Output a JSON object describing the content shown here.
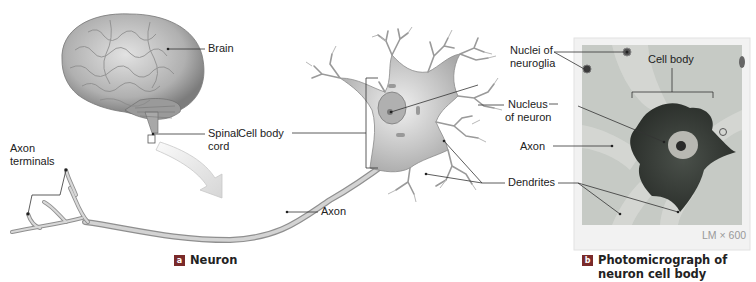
{
  "panel_a": {
    "badge": "a",
    "caption": "Neuron",
    "labels": {
      "brain": "Brain",
      "spinal_cord_1": "Spinal",
      "spinal_cord_2": "cord",
      "axon_terminals_1": "Axon",
      "axon_terminals_2": "terminals",
      "cell_body": "Cell body",
      "axon": "Axon"
    }
  },
  "shared_labels": {
    "nucleus_1": "Nucleus",
    "nucleus_2": "of neuron",
    "dendrites": "Dendrites"
  },
  "panel_b": {
    "badge": "b",
    "caption_1": "Photomicrograph of",
    "caption_2": "neuron cell body",
    "scale": "LM × 600",
    "labels": {
      "nuclei_neuroglia_1": "Nuclei of",
      "nuclei_neuroglia_2": "neuroglia",
      "cell_body": "Cell body",
      "axon": "Axon"
    }
  },
  "colors": {
    "badge": "#7a2a2a",
    "neuron_fill": "#c9c9c9",
    "micrograph_bg": "#c4c8c4",
    "stain": "#3a3f3a"
  }
}
